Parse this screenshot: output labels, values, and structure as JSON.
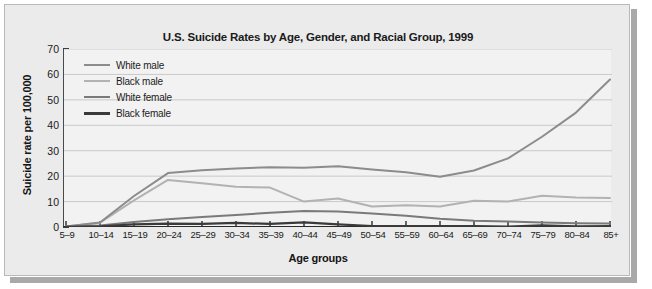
{
  "figure": {
    "title": "U.S. Suicide Rates by Age, Gender, and Racial Group, 1999",
    "frame_bg": "#ebebeb",
    "plot_bg": "#f2f2f2",
    "shadow_color": "#a9a9a9"
  },
  "chart_data": {
    "type": "line",
    "title": "U.S. Suicide Rates by Age, Gender, and Racial Group, 1999",
    "xlabel": "Age groups",
    "ylabel": "Suicide rate per 100,000",
    "ylim": [
      0,
      70
    ],
    "ytick_step": 10,
    "yticks": [
      0,
      10,
      20,
      30,
      40,
      50,
      60,
      70
    ],
    "grid": true,
    "legend_position": "upper-left-inside",
    "categories": [
      "5–9",
      "10–14",
      "15–19",
      "20–24",
      "25–29",
      "30–34",
      "35–39",
      "40–44",
      "45–49",
      "50–54",
      "55–59",
      "60–64",
      "65–69",
      "70–74",
      "75–79",
      "80–84",
      "85+"
    ],
    "series": [
      {
        "name": "White male",
        "color": "#8c8c8c",
        "values": [
          0.2,
          1.8,
          12.2,
          21.2,
          22.3,
          23.0,
          23.5,
          23.3,
          23.9,
          22.6,
          21.5,
          19.8,
          22.2,
          27.0,
          35.5,
          45.0,
          58.0
        ]
      },
      {
        "name": "Black male",
        "color": "#b2b2b2",
        "values": [
          0.2,
          1.7,
          10.5,
          18.5,
          17.2,
          15.8,
          15.5,
          10.0,
          11.2,
          8.1,
          8.6,
          8.1,
          10.3,
          10.0,
          12.3,
          11.6,
          11.4
        ]
      },
      {
        "name": "White female",
        "color": "#7a7a7a",
        "values": [
          0.1,
          0.6,
          2.0,
          3.0,
          3.9,
          4.7,
          5.6,
          6.3,
          6.1,
          5.3,
          4.4,
          3.2,
          2.5,
          2.2,
          1.8,
          1.5,
          1.4
        ]
      },
      {
        "name": "Black female",
        "color": "#3a3a3a",
        "values": [
          0.1,
          0.3,
          1.0,
          1.3,
          1.2,
          1.6,
          1.2,
          1.8,
          1.0,
          0.4,
          0.4,
          0.4,
          0.4,
          0.2,
          0.6,
          0.3,
          0.4
        ]
      }
    ]
  }
}
